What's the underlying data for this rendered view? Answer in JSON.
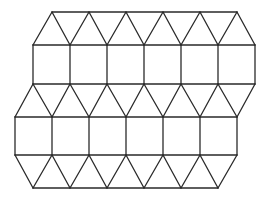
{
  "diagram": {
    "stroke_color": "#2a2a2a",
    "background": "#ffffff",
    "rows": {
      "y_top": 12,
      "y_a": 45,
      "y_b": 84,
      "y_c": 117,
      "y_d": 155,
      "y_bottom": 188
    },
    "row_top_x": [
      52,
      89,
      126,
      163,
      200,
      237
    ],
    "row_a_x": [
      33,
      70,
      107,
      144,
      181,
      218,
      255
    ],
    "row_b_x": [
      33,
      70,
      107,
      144,
      181,
      218,
      255
    ],
    "row_c_x": [
      15,
      52,
      89,
      126,
      163,
      200,
      237
    ],
    "row_d_x": [
      15,
      52,
      89,
      126,
      163,
      200,
      237
    ],
    "row_bottom_x": [
      33,
      70,
      107,
      144,
      181,
      218
    ]
  }
}
